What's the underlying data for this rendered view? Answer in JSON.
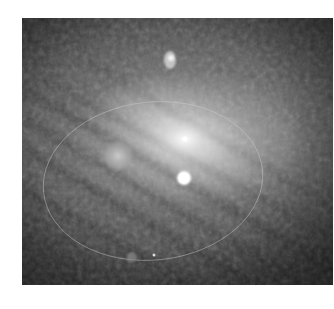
{
  "image": {
    "subject": "spiral galaxy (grayscale telescope image)",
    "features": [
      {
        "name": "galaxy-core",
        "x": 185,
        "y": 139
      },
      {
        "name": "bright-star",
        "x": 184,
        "y": 178
      },
      {
        "name": "diffuse-glow",
        "x": 118,
        "y": 156
      },
      {
        "name": "small-spiral-galaxy",
        "x": 170,
        "y": 60
      }
    ],
    "overlay": {
      "shape": "ellipse",
      "cx": 153,
      "cy": 181,
      "rx": 110,
      "ry": 80
    }
  },
  "colors": {
    "background": "#ffffff",
    "core": "#ffffff",
    "sky": "#3a3a3a"
  }
}
